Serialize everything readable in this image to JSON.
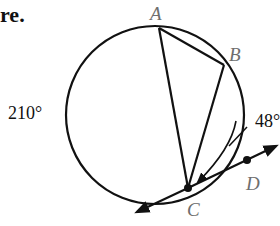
{
  "heading_fragment": "re.",
  "points": {
    "A": {
      "label": "A",
      "x": 159,
      "y": 28
    },
    "B": {
      "label": "B",
      "x": 224,
      "y": 65
    },
    "C": {
      "label": "C",
      "x": 188,
      "y": 188
    },
    "D": {
      "label": "D",
      "x": 247,
      "y": 160
    }
  },
  "circle": {
    "cx": 155,
    "cy": 115,
    "r": 89
  },
  "arc_labels": {
    "major_arc": "210°",
    "minor_arc": "48°"
  },
  "colors": {
    "stroke": "#111111",
    "label": "#6e6e6e",
    "background": "#ffffff"
  }
}
